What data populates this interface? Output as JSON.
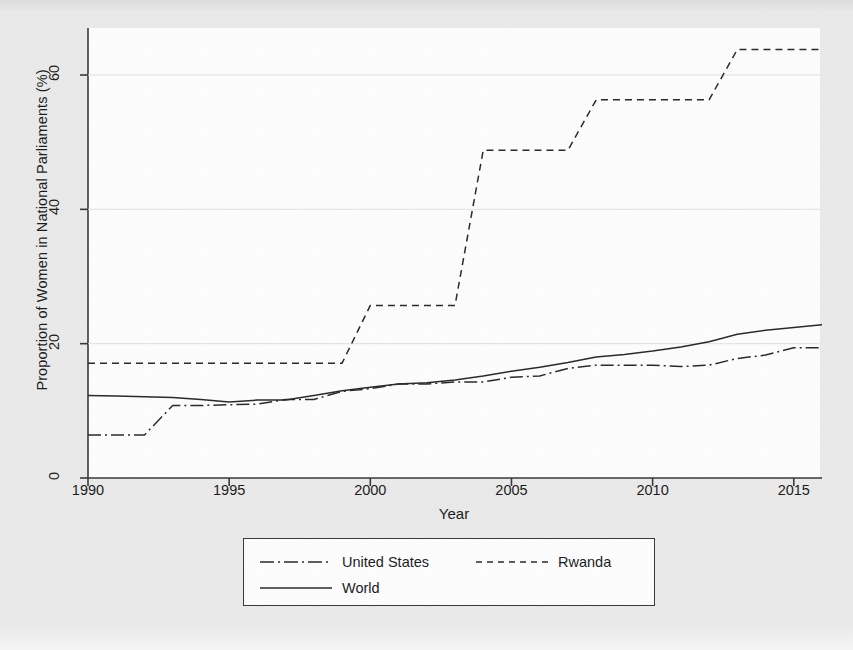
{
  "chart_data": {
    "type": "line",
    "title": "",
    "xlabel": "Year",
    "ylabel": "Proportion of Women in National Parliaments (%)",
    "xlim": [
      1990,
      2016
    ],
    "ylim": [
      0,
      67
    ],
    "xticks": [
      1990,
      1995,
      2000,
      2005,
      2010,
      2015
    ],
    "yticks": [
      0,
      20,
      40,
      60
    ],
    "grid": false,
    "legend_position": "below-center",
    "x": [
      1990,
      1991,
      1992,
      1993,
      1994,
      1995,
      1996,
      1997,
      1998,
      1999,
      2000,
      2001,
      2002,
      2003,
      2004,
      2005,
      2006,
      2007,
      2008,
      2009,
      2010,
      2011,
      2012,
      2013,
      2014,
      2015,
      2016
    ],
    "series": [
      {
        "name": "United States",
        "style": "dash-dot",
        "values": [
          6.4,
          6.4,
          6.4,
          10.8,
          10.8,
          10.9,
          11.0,
          11.7,
          11.7,
          12.9,
          13.3,
          14.0,
          14.0,
          14.3,
          14.3,
          15.0,
          15.2,
          16.3,
          16.8,
          16.8,
          16.8,
          16.6,
          16.8,
          17.8,
          18.3,
          19.4,
          19.4
        ]
      },
      {
        "name": "Rwanda",
        "style": "dashed",
        "values": [
          17.1,
          17.1,
          17.1,
          17.1,
          17.1,
          17.1,
          17.1,
          17.1,
          17.1,
          17.1,
          25.7,
          25.7,
          25.7,
          25.7,
          48.8,
          48.8,
          48.8,
          48.8,
          56.3,
          56.3,
          56.3,
          56.3,
          56.3,
          63.8,
          63.8,
          63.8,
          63.8
        ]
      },
      {
        "name": "World",
        "style": "solid",
        "values": [
          12.3,
          12.2,
          12.1,
          12.0,
          11.7,
          11.3,
          11.6,
          11.6,
          12.3,
          13.0,
          13.5,
          14.0,
          14.2,
          14.6,
          15.2,
          15.9,
          16.5,
          17.2,
          18.0,
          18.4,
          18.9,
          19.5,
          20.3,
          21.4,
          22.0,
          22.4,
          22.8
        ]
      }
    ]
  },
  "axis": {
    "x_label": "Year",
    "y_label": "Proportion of Women in National Parliaments (%)",
    "x_tick_labels": [
      "1990",
      "1995",
      "2000",
      "2005",
      "2010",
      "2015"
    ],
    "y_tick_labels": [
      "0",
      "20",
      "40",
      "60"
    ]
  },
  "legend": {
    "entries": [
      {
        "label": "United States",
        "style": "dash-dot"
      },
      {
        "label": "Rwanda",
        "style": "dashed"
      },
      {
        "label": "World",
        "style": "solid"
      }
    ]
  },
  "colors": {
    "line": "#2b2b2b",
    "axis": "#3a3a3a",
    "page_background": "#eaeaea",
    "plot_background": "#fdfdfd"
  }
}
